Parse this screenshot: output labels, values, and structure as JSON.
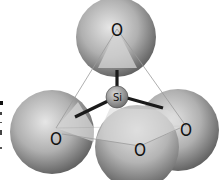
{
  "diagram": {
    "central_atom": {
      "label": "Si",
      "cx": 117,
      "cy": 97,
      "r": 11
    },
    "oxygen_atoms": [
      {
        "id": "top",
        "label": "O",
        "cx": 116,
        "cy": 37,
        "r": 40
      },
      {
        "id": "left",
        "label": "O",
        "cx": 52,
        "cy": 132,
        "r": 42
      },
      {
        "id": "right",
        "label": "O",
        "cx": 178,
        "cy": 130,
        "r": 41
      },
      {
        "id": "front",
        "label": "O",
        "cx": 137,
        "cy": 147,
        "r": 42
      }
    ],
    "colors": {
      "sphere_light": "#e2e2e2",
      "sphere_dark": "#6e6e6e",
      "bond": "#1a1a1a",
      "edge_line": "#9a9a9a",
      "face": "#d6d6d6"
    }
  }
}
